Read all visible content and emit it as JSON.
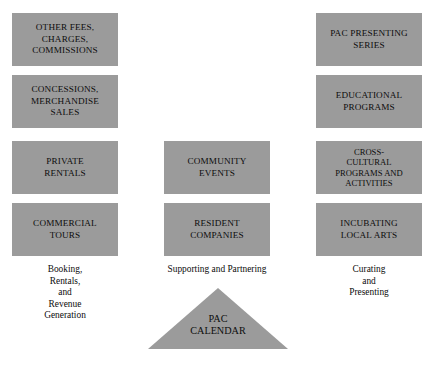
{
  "theme": {
    "background_color": "#ffffff",
    "box_fill_color": "#9b9b9b",
    "triangle_fill_color": "#9b9b9b",
    "text_color": "#0d0d0d"
  },
  "columns": [
    {
      "id": "revenue",
      "caption": "Booking,\nRentals,\nand\nRevenue\nGeneration",
      "boxes": [
        {
          "label": "OTHER FEES,\nCHARGES,\nCOMMISSIONS"
        },
        {
          "label": "CONCESSIONS,\nMERCHANDISE\nSALES"
        },
        {
          "label": "PRIVATE\nRENTALS"
        },
        {
          "label": "COMMERCIAL\nTOURS"
        }
      ]
    },
    {
      "id": "community",
      "caption": "Supporting and Partnering",
      "boxes": [
        {
          "label": "COMMUNITY\nEVENTS"
        },
        {
          "label": "RESIDENT\nCOMPANIES"
        }
      ]
    },
    {
      "id": "programming",
      "caption": "Curating\nand\nPresenting",
      "boxes": [
        {
          "label": "PAC PRESENTING\nSERIES"
        },
        {
          "label": "EDUCATIONAL\nPROGRAMS"
        },
        {
          "label": "CROSS-\nCULTURAL\nPROGRAMS AND\nACTIVITIES"
        },
        {
          "label": "INCUBATING\nLOCAL ARTS"
        }
      ]
    }
  ],
  "footer": {
    "triangle_label": "PAC\nCALENDAR"
  }
}
